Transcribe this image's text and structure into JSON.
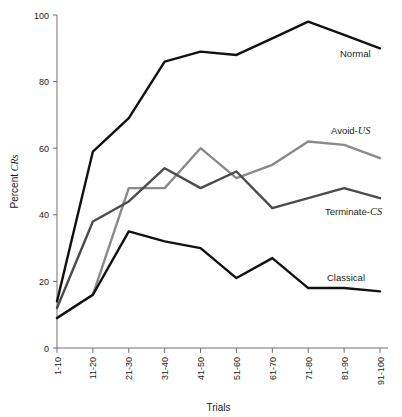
{
  "chart_data": {
    "type": "line",
    "title": "",
    "xlabel": "Trials",
    "ylabel": "Percent CRs",
    "ylabel_parts": {
      "plain": "Percent ",
      "italic": "CRs"
    },
    "categories": [
      "1-10",
      "11-20",
      "21-30",
      "31-40",
      "41-50",
      "51-60",
      "61-70",
      "71-80",
      "81-90",
      "91-100"
    ],
    "xlim": [
      0,
      9
    ],
    "ylim": [
      0,
      100
    ],
    "ytick_labels": [
      "0",
      "20",
      "40",
      "60",
      "80",
      "100"
    ],
    "yticks": [
      0,
      20,
      40,
      60,
      80,
      100
    ],
    "grid": false,
    "legend": "inline-right-of-line-ends",
    "series": [
      {
        "name": "Normal",
        "label_plain": "Normal",
        "label_italic": "",
        "color": "#111111",
        "width": 2.4,
        "values": [
          14,
          59,
          69,
          86,
          89,
          88,
          93,
          98,
          94,
          90
        ],
        "label_x": 340,
        "label_y": 57
      },
      {
        "name": "Avoid-US",
        "label_plain": "Avoid-",
        "label_italic": "US",
        "color": "#8a8a8a",
        "width": 2.4,
        "values": [
          9,
          16,
          48,
          48,
          60,
          51,
          55,
          62,
          61,
          57
        ],
        "label_x": 331,
        "label_y": 134
      },
      {
        "name": "Terminate-CS",
        "label_plain": "Terminate-",
        "label_italic": "CS",
        "color": "#4b4b4b",
        "width": 2.4,
        "values": [
          12,
          38,
          44,
          54,
          48,
          53,
          42,
          45,
          48,
          45
        ],
        "label_x": 325,
        "label_y": 215
      },
      {
        "name": "Classical",
        "label_plain": "Classical",
        "label_italic": "",
        "color": "#111111",
        "width": 2.4,
        "values": [
          9,
          16,
          35,
          32,
          30,
          21,
          27,
          18,
          18,
          17
        ],
        "label_x": 327,
        "label_y": 281
      }
    ]
  },
  "axes": {
    "y_title": "Percent CRs",
    "x_title": "Trials"
  }
}
